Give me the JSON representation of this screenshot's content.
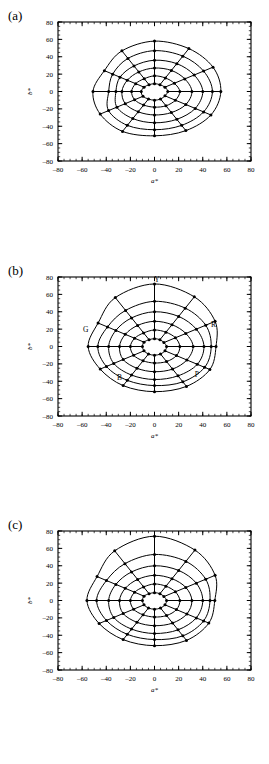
{
  "figure": {
    "width": 269,
    "height": 764,
    "background": "#ffffff",
    "ink": "#000000"
  },
  "axes": {
    "x_label": "a*",
    "y_label": "b*",
    "xlim": [
      -80,
      80
    ],
    "ylim": [
      -80,
      80
    ],
    "major_step": 20,
    "minor_step": 5,
    "tick_labels": [
      "–80",
      "–60",
      "–40",
      "–20",
      "0",
      "20",
      "40",
      "60",
      "80"
    ],
    "tick_values": [
      -80,
      -60,
      -40,
      -20,
      0,
      20,
      40,
      60,
      80
    ],
    "grid": false
  },
  "panels": [
    {
      "id": "a",
      "label": "(a)"
    },
    {
      "id": "b",
      "label": "(b)"
    },
    {
      "id": "c",
      "label": "(c)"
    }
  ],
  "hue_labels": [
    {
      "text": "Y",
      "a": 2,
      "b": 74
    },
    {
      "text": "R",
      "a": 49,
      "b": 23
    },
    {
      "text": "G",
      "a": -57,
      "b": 17
    },
    {
      "text": "B",
      "a": -29,
      "b": -39
    },
    {
      "text": "P",
      "a": 35,
      "b": -35
    }
  ],
  "chart_data": {
    "type": "line",
    "title": "",
    "subtitle": "",
    "xlabel": "a*",
    "ylabel": "b*",
    "xlim": [
      -80,
      80
    ],
    "ylim": [
      -80,
      80
    ],
    "legend": "none",
    "coordinate_system": "cartesian-from-polar-web",
    "n_rings": 6,
    "n_spokes": 12,
    "spoke_angles_deg": [
      0,
      30,
      60,
      90,
      120,
      150,
      180,
      210,
      240,
      270,
      300,
      330
    ],
    "marker": "filled-circle",
    "series": [
      {
        "name": "panel-a",
        "panel": "a",
        "note": "Asymmetric gamut with a pronounced notch at the left (green) side; smallest overall extent of the three.",
        "rings": [
          {
            "level": 1,
            "radii": [
              11,
              10,
              9,
              9,
              9,
              10,
              11,
              11,
              10,
              10,
              10,
              10
            ]
          },
          {
            "level": 2,
            "radii": [
              21,
              19,
              18,
              18,
              17,
              18,
              19,
              19,
              18,
              18,
              19,
              20
            ]
          },
          {
            "level": 3,
            "radii": [
              31,
              29,
              28,
              27,
              26,
              26,
              27,
              28,
              27,
              27,
              28,
              30
            ]
          },
          {
            "level": 4,
            "radii": [
              40,
              38,
              37,
              36,
              34,
              33,
              32,
              36,
              36,
              36,
              37,
              39
            ]
          },
          {
            "level": 5,
            "radii": [
              48,
              47,
              47,
              47,
              44,
              40,
              38,
              44,
              45,
              44,
              45,
              47
            ]
          },
          {
            "level": 6,
            "radii": [
              55,
              56,
              57,
              58,
              54,
              48,
              51,
              52,
              53,
              51,
              52,
              54
            ]
          }
        ]
      },
      {
        "name": "panel-b",
        "panel": "b",
        "note": "Largest, smoothest gamut; rounded in yellow and red, slightly flattened at green.",
        "rings": [
          {
            "level": 1,
            "radii": [
              10,
              9,
              9,
              9,
              9,
              10,
              10,
              10,
              10,
              10,
              10,
              10
            ]
          },
          {
            "level": 2,
            "radii": [
              21,
              20,
              19,
              19,
              18,
              19,
              20,
              20,
              19,
              19,
              20,
              21
            ]
          },
          {
            "level": 3,
            "radii": [
              32,
              30,
              29,
              29,
              28,
              28,
              29,
              30,
              29,
              29,
              30,
              31
            ]
          },
          {
            "level": 4,
            "radii": [
              41,
              40,
              40,
              40,
              38,
              37,
              38,
              39,
              38,
              38,
              39,
              41
            ]
          },
          {
            "level": 5,
            "radii": [
              47,
              49,
              51,
              52,
              48,
              45,
              47,
              46,
              45,
              45,
              47,
              48
            ]
          },
          {
            "level": 6,
            "radii": [
              51,
              58,
              66,
              72,
              65,
              54,
              55,
              52,
              52,
              52,
              53,
              53
            ]
          }
        ]
      },
      {
        "name": "panel-c",
        "panel": "c",
        "note": "Intermediate gamut; rounded yellow lobe, mild indentation toward green-blue.",
        "rings": [
          {
            "level": 1,
            "radii": [
              10,
              9,
              9,
              9,
              9,
              10,
              10,
              10,
              10,
              10,
              10,
              10
            ]
          },
          {
            "level": 2,
            "radii": [
              21,
              20,
              19,
              19,
              18,
              19,
              20,
              20,
              19,
              19,
              20,
              21
            ]
          },
          {
            "level": 3,
            "radii": [
              31,
              30,
              29,
              29,
              28,
              28,
              29,
              30,
              29,
              29,
              30,
              31
            ]
          },
          {
            "level": 4,
            "radii": [
              40,
              40,
              40,
              40,
              38,
              37,
              38,
              39,
              38,
              38,
              39,
              40
            ]
          },
          {
            "level": 5,
            "radii": [
              46,
              49,
              52,
              53,
              49,
              46,
              48,
              46,
              45,
              45,
              47,
              47
            ]
          },
          {
            "level": 6,
            "radii": [
              50,
              58,
              67,
              74,
              66,
              55,
              56,
              53,
              52,
              52,
              53,
              52
            ]
          }
        ]
      }
    ]
  }
}
